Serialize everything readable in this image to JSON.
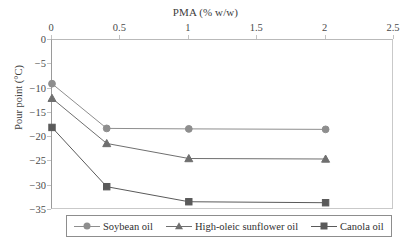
{
  "chart_data": {
    "type": "line",
    "title": "PMA (% w/w)",
    "xlabel": "PMA (% w/w)",
    "ylabel": "Pour point (°C)",
    "xlim": [
      0,
      2.5
    ],
    "ylim": [
      -35,
      0
    ],
    "x_ticks": [
      "0",
      "0.5",
      "1",
      "1.5",
      "2",
      "2.5"
    ],
    "x_tick_values": [
      0,
      0.5,
      1,
      1.5,
      2,
      2.5
    ],
    "y_ticks": [
      "0",
      "−5",
      "−10",
      "−15",
      "−20",
      "−25",
      "−30",
      "−35"
    ],
    "y_tick_values": [
      0,
      -5,
      -10,
      -15,
      -20,
      -25,
      -30,
      -35
    ],
    "x": [
      0,
      0.4,
      1,
      2
    ],
    "grid": false,
    "legend_position": "bottom",
    "x_axis_position": "top",
    "series": [
      {
        "name": "Soybean oil",
        "marker": "circle",
        "color": "#8e8e8e",
        "values": [
          -9.0,
          -18.2,
          -18.3,
          -18.4
        ]
      },
      {
        "name": "High-oleic sunflower oil",
        "marker": "triangle",
        "color": "#6f6f6f",
        "values": [
          -12.0,
          -21.3,
          -24.4,
          -24.5
        ]
      },
      {
        "name": "Canola oil",
        "marker": "square",
        "color": "#5a5a5a",
        "values": [
          -18.0,
          -30.2,
          -33.3,
          -33.5
        ]
      }
    ]
  },
  "legend": {
    "items": [
      {
        "label": "Soybean oil"
      },
      {
        "label": "High-oleic sunflower oil"
      },
      {
        "label": "Canola oil"
      }
    ]
  }
}
